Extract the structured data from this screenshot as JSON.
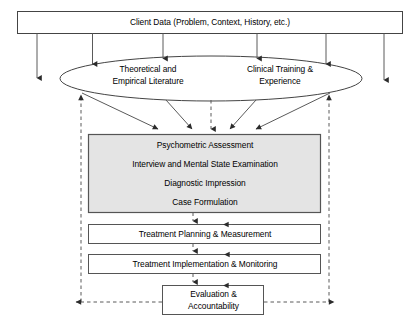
{
  "diagram": {
    "colors": {
      "stroke": "#333333",
      "text": "#000000",
      "assessment_box_fill": "#e4e4e4",
      "plain_box_fill": "#ffffff",
      "background": "#ffffff"
    },
    "nodes": {
      "client_data": {
        "label": "Client Data (Problem, Context, History, etc.)",
        "shape": "rectangle"
      },
      "literature": {
        "label_line_1": "Theoretical and",
        "label_line_2": "Empirical Literature",
        "shape": "ellipse-left-half"
      },
      "training": {
        "label_line_1": "Clinical Training &",
        "label_line_2": "Experience",
        "shape": "ellipse-right-half"
      },
      "assessment": {
        "items": [
          "Psychometric Assessment",
          "Interview and Mental State Examination",
          "Diagnostic Impression",
          "Case Formulation"
        ],
        "shape": "rectangle-shaded"
      },
      "treatment_planning": {
        "label": "Treatment Planning & Measurement",
        "shape": "rectangle"
      },
      "treatment_implementation": {
        "label": "Treatment Implementation & Monitoring",
        "shape": "rectangle"
      },
      "evaluation": {
        "label_line_1": "Evaluation &",
        "label_line_2": "Accountability",
        "shape": "rectangle"
      }
    },
    "edges": {
      "solid_down_label": "data flows downward",
      "dashed_up_label": "feedback flows upward"
    }
  }
}
